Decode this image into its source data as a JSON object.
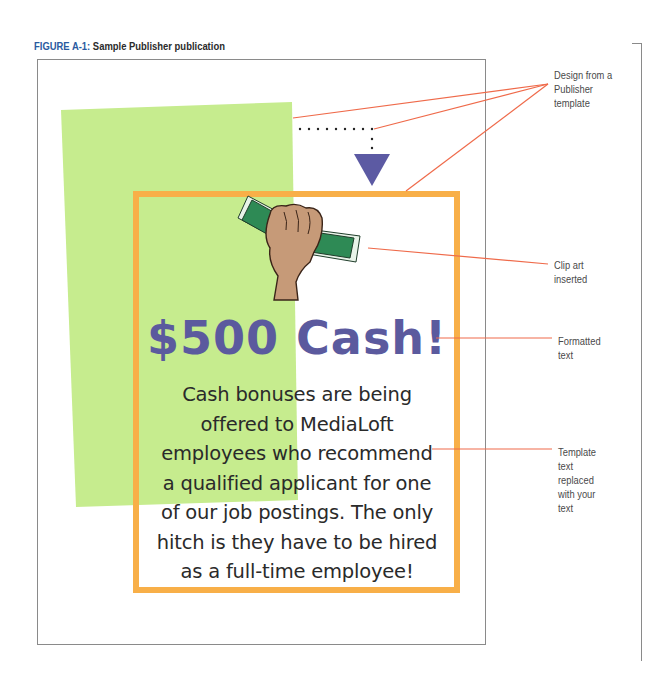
{
  "caption": {
    "figure_label": "FIGURE A-1:",
    "title": "Sample Publisher publication"
  },
  "publication": {
    "headline": "$500 Cash!",
    "body_lines": [
      "Cash bonuses are being",
      "offered to MediaLoft",
      "employees who recommend",
      "a qualified applicant for one",
      "of our job postings.  The only",
      "hitch is they have to be hired",
      "as a full-time employee!"
    ],
    "clip_art": "hand-holding-cash-icon",
    "colors": {
      "green_block": "#c6ec8e",
      "frame_orange": "#f8af48",
      "headline_purple": "#5b5a9e",
      "arrow_purple": "#5c5aa3",
      "callout_line": "#ef6a4a"
    }
  },
  "callouts": [
    {
      "id": "design",
      "lines": [
        "Design from a",
        "Publisher",
        "template"
      ]
    },
    {
      "id": "clipart",
      "lines": [
        "Clip art",
        "inserted"
      ]
    },
    {
      "id": "formatted",
      "lines": [
        "Formatted",
        "text"
      ]
    },
    {
      "id": "template_text",
      "lines": [
        "Template",
        "text",
        "replaced",
        "with your",
        "text"
      ]
    }
  ]
}
